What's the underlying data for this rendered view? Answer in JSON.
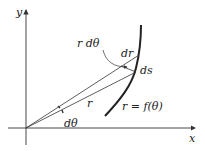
{
  "diagram": {
    "axes": {
      "x_label": "x",
      "y_label": "y"
    },
    "labels": {
      "r_dtheta": "r dθ",
      "dr": "dr",
      "ds": "ds",
      "r": "r",
      "dtheta": "dθ",
      "curve": "r = f(θ)"
    },
    "colors": {
      "stroke": "#333333",
      "curve": "#222222",
      "background": "#ffffff"
    }
  }
}
